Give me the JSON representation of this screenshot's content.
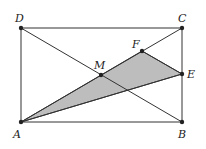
{
  "diagram": {
    "type": "geometry",
    "points": {
      "A": {
        "label": "A",
        "x": 21,
        "y": 122
      },
      "B": {
        "label": "B",
        "x": 182,
        "y": 122
      },
      "C": {
        "label": "C",
        "x": 182,
        "y": 28
      },
      "D": {
        "label": "D",
        "x": 21,
        "y": 28
      },
      "M": {
        "label": "M",
        "x": 101,
        "y": 75
      },
      "F": {
        "label": "F",
        "x": 142,
        "y": 51
      },
      "E": {
        "label": "E",
        "x": 182,
        "y": 74
      }
    },
    "shaded_region": [
      "A",
      "F",
      "E"
    ],
    "colors": {
      "line": "#333333",
      "fill": "#bdbdbd",
      "point": "#222222"
    }
  }
}
